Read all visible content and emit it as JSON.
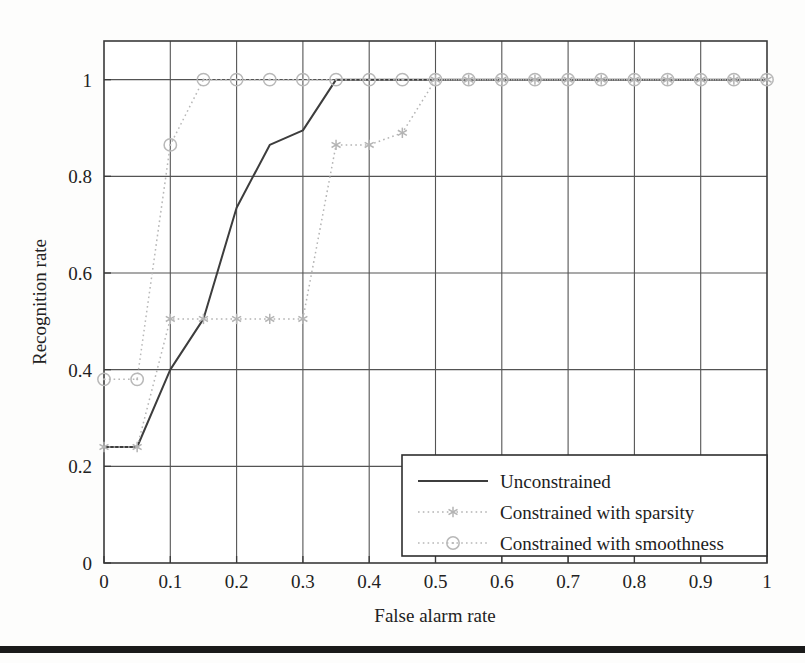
{
  "figure": {
    "background_color": "#fdfdfc",
    "axis_color": "#3a3a3a",
    "grid_color": "#545454",
    "footer_rule_color": "#1a1a1a"
  },
  "chart_data": {
    "type": "line",
    "title": "",
    "xlabel": "False alarm rate",
    "ylabel": "Recognition rate",
    "xlim": [
      0,
      1
    ],
    "ylim": [
      0,
      1.08
    ],
    "xticks": [
      "0",
      "0.1",
      "0.2",
      "0.3",
      "0.4",
      "0.5",
      "0.6",
      "0.7",
      "0.8",
      "0.9",
      "1"
    ],
    "xtick_values": [
      0,
      0.1,
      0.2,
      0.3,
      0.4,
      0.5,
      0.6,
      0.7,
      0.8,
      0.9,
      1
    ],
    "yticks": [
      "0",
      "0.2",
      "0.4",
      "0.6",
      "0.8",
      "1"
    ],
    "ytick_values": [
      0,
      0.2,
      0.4,
      0.6,
      0.8,
      1
    ],
    "grid": true,
    "legend_position": "lower right",
    "x": [
      0,
      0.05,
      0.1,
      0.15,
      0.2,
      0.25,
      0.3,
      0.35,
      0.4,
      0.45,
      0.5,
      0.55,
      0.6,
      0.65,
      0.7,
      0.75,
      0.8,
      0.85,
      0.9,
      0.95,
      1
    ],
    "series": [
      {
        "name": "Unconstrained",
        "color": "#3d3d3d",
        "style": "solid",
        "marker": "none",
        "values": [
          0.24,
          0.24,
          0.4,
          0.505,
          0.735,
          0.865,
          0.895,
          1.0,
          1.0,
          1.0,
          1.0,
          1.0,
          1.0,
          1.0,
          1.0,
          1.0,
          1.0,
          1.0,
          1.0,
          1.0,
          1.0
        ]
      },
      {
        "name": "Constrained with sparsity",
        "color": "#b4b4b4",
        "style": "dotted",
        "marker": "star",
        "values": [
          0.24,
          0.24,
          0.505,
          0.505,
          0.505,
          0.505,
          0.505,
          0.865,
          0.865,
          0.89,
          1.0,
          1.0,
          1.0,
          1.0,
          1.0,
          1.0,
          1.0,
          1.0,
          1.0,
          1.0,
          1.0
        ]
      },
      {
        "name": "Constrained with smoothness",
        "color": "#b8b8b8",
        "style": "dotted",
        "marker": "circle",
        "values": [
          0.38,
          0.38,
          0.865,
          1.0,
          1.0,
          1.0,
          1.0,
          1.0,
          1.0,
          1.0,
          1.0,
          1.0,
          1.0,
          1.0,
          1.0,
          1.0,
          1.0,
          1.0,
          1.0,
          1.0,
          1.0
        ]
      }
    ],
    "legend": [
      {
        "label": "Unconstrained",
        "style": "solid",
        "marker": "none",
        "color": "#3d3d3d"
      },
      {
        "label": "Constrained with sparsity",
        "style": "dotted",
        "marker": "star",
        "color": "#b4b4b4"
      },
      {
        "label": "Constrained with smoothness",
        "style": "dotted",
        "marker": "circle",
        "color": "#b8b8b8"
      }
    ]
  }
}
